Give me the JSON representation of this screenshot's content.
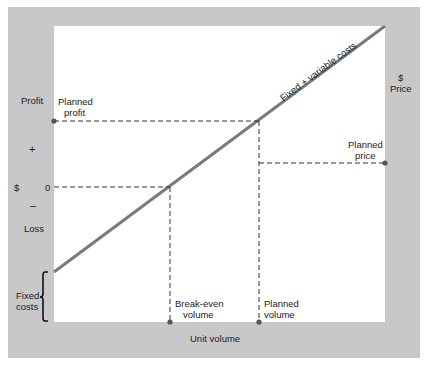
{
  "diagram": {
    "colors": {
      "frame": "#c8c8c8",
      "plot": "#ffffff",
      "cost_line": "#7a7a7a",
      "dashes": "#333333",
      "text": "#222222"
    },
    "left_axis": {
      "profit_label": "Profit",
      "plus_label": "+",
      "dollar_label": "$",
      "zero_label": "0",
      "minus_label": "–",
      "loss_label": "Loss",
      "fixed_costs_label_line1": "Fixed",
      "fixed_costs_label_line2": "costs"
    },
    "right_axis": {
      "dollar_label": "$",
      "price_label": "Price"
    },
    "x_axis": {
      "label": "Unit volume"
    },
    "annotations": {
      "planned_profit_line1": "Planned",
      "planned_profit_line2": "profit",
      "planned_price_line1": "Planned",
      "planned_price_line2": "price",
      "break_even_line1": "Break-even",
      "break_even_line2": "volume",
      "planned_volume_line1": "Planned",
      "planned_volume_line2": "volume",
      "cost_line_label": "Fixed + variable costs"
    }
  }
}
